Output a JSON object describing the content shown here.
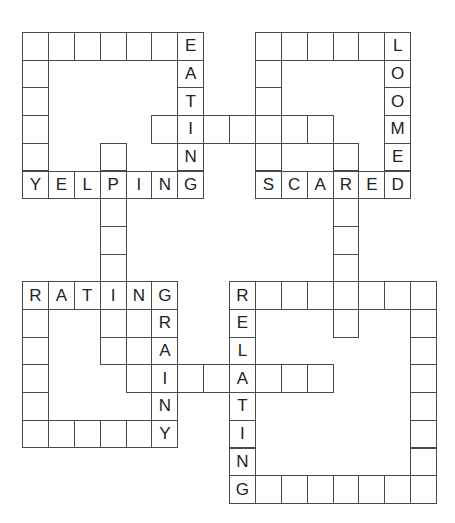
{
  "puzzle": {
    "type": "crossword",
    "words": [
      {
        "id": "top-left-box",
        "label": "",
        "cells": "box"
      },
      {
        "word": "EATING",
        "direction": "down"
      },
      {
        "word": "YELPING",
        "direction": "across"
      },
      {
        "word": "LOOMED",
        "direction": "down"
      },
      {
        "word": "SCARED",
        "direction": "across"
      },
      {
        "word": "RATING",
        "direction": "across"
      },
      {
        "word": "GRAINY",
        "direction": "down"
      },
      {
        "word": "RELATING",
        "direction": "down"
      }
    ],
    "cells": [
      {
        "r": 0,
        "c": 0,
        "ch": ""
      },
      {
        "r": 0,
        "c": 1,
        "ch": ""
      },
      {
        "r": 0,
        "c": 2,
        "ch": ""
      },
      {
        "r": 0,
        "c": 3,
        "ch": ""
      },
      {
        "r": 0,
        "c": 4,
        "ch": ""
      },
      {
        "r": 0,
        "c": 5,
        "ch": ""
      },
      {
        "r": 0,
        "c": 6,
        "ch": "E"
      },
      {
        "r": 1,
        "c": 0,
        "ch": ""
      },
      {
        "r": 1,
        "c": 6,
        "ch": "A"
      },
      {
        "r": 2,
        "c": 0,
        "ch": ""
      },
      {
        "r": 2,
        "c": 6,
        "ch": "T"
      },
      {
        "r": 3,
        "c": 0,
        "ch": ""
      },
      {
        "r": 3,
        "c": 5,
        "ch": ""
      },
      {
        "r": 3,
        "c": 6,
        "ch": "I"
      },
      {
        "r": 3,
        "c": 7,
        "ch": ""
      },
      {
        "r": 3,
        "c": 8,
        "ch": ""
      },
      {
        "r": 3,
        "c": 9,
        "ch": ""
      },
      {
        "r": 3,
        "c": 10,
        "ch": ""
      },
      {
        "r": 3,
        "c": 11,
        "ch": ""
      },
      {
        "r": 4,
        "c": 0,
        "ch": ""
      },
      {
        "r": 4,
        "c": 3,
        "ch": ""
      },
      {
        "r": 4,
        "c": 6,
        "ch": "N"
      },
      {
        "r": 5,
        "c": 0,
        "ch": "Y"
      },
      {
        "r": 5,
        "c": 1,
        "ch": "E"
      },
      {
        "r": 5,
        "c": 2,
        "ch": "L"
      },
      {
        "r": 5,
        "c": 3,
        "ch": "P"
      },
      {
        "r": 5,
        "c": 4,
        "ch": "I"
      },
      {
        "r": 5,
        "c": 5,
        "ch": "N"
      },
      {
        "r": 5,
        "c": 6,
        "ch": "G"
      },
      {
        "r": 0,
        "c": 9,
        "ch": ""
      },
      {
        "r": 0,
        "c": 10,
        "ch": ""
      },
      {
        "r": 0,
        "c": 11,
        "ch": ""
      },
      {
        "r": 0,
        "c": 12,
        "ch": ""
      },
      {
        "r": 0,
        "c": 13,
        "ch": ""
      },
      {
        "r": 0,
        "c": 14,
        "ch": "L"
      },
      {
        "r": 1,
        "c": 9,
        "ch": ""
      },
      {
        "r": 1,
        "c": 14,
        "ch": "O"
      },
      {
        "r": 2,
        "c": 9,
        "ch": ""
      },
      {
        "r": 2,
        "c": 14,
        "ch": "O"
      },
      {
        "r": 3,
        "c": 14,
        "ch": "M"
      },
      {
        "r": 4,
        "c": 9,
        "ch": ""
      },
      {
        "r": 4,
        "c": 12,
        "ch": ""
      },
      {
        "r": 4,
        "c": 14,
        "ch": "E"
      },
      {
        "r": 5,
        "c": 9,
        "ch": "S"
      },
      {
        "r": 5,
        "c": 10,
        "ch": "C"
      },
      {
        "r": 5,
        "c": 11,
        "ch": "A"
      },
      {
        "r": 5,
        "c": 12,
        "ch": "R"
      },
      {
        "r": 5,
        "c": 13,
        "ch": "E"
      },
      {
        "r": 5,
        "c": 14,
        "ch": "D"
      },
      {
        "r": 6,
        "c": 3,
        "ch": ""
      },
      {
        "r": 7,
        "c": 3,
        "ch": ""
      },
      {
        "r": 8,
        "c": 3,
        "ch": ""
      },
      {
        "r": 6,
        "c": 12,
        "ch": ""
      },
      {
        "r": 7,
        "c": 12,
        "ch": ""
      },
      {
        "r": 8,
        "c": 12,
        "ch": ""
      },
      {
        "r": 9,
        "c": 0,
        "ch": "R"
      },
      {
        "r": 9,
        "c": 1,
        "ch": "A"
      },
      {
        "r": 9,
        "c": 2,
        "ch": "T"
      },
      {
        "r": 9,
        "c": 3,
        "ch": "I"
      },
      {
        "r": 9,
        "c": 4,
        "ch": "N"
      },
      {
        "r": 9,
        "c": 5,
        "ch": "G"
      },
      {
        "r": 10,
        "c": 0,
        "ch": ""
      },
      {
        "r": 10,
        "c": 3,
        "ch": ""
      },
      {
        "r": 10,
        "c": 4,
        "ch": ""
      },
      {
        "r": 10,
        "c": 5,
        "ch": "R"
      },
      {
        "r": 11,
        "c": 0,
        "ch": ""
      },
      {
        "r": 11,
        "c": 3,
        "ch": ""
      },
      {
        "r": 11,
        "c": 4,
        "ch": ""
      },
      {
        "r": 11,
        "c": 5,
        "ch": "A"
      },
      {
        "r": 12,
        "c": 0,
        "ch": ""
      },
      {
        "r": 12,
        "c": 4,
        "ch": ""
      },
      {
        "r": 12,
        "c": 5,
        "ch": "I"
      },
      {
        "r": 12,
        "c": 6,
        "ch": ""
      },
      {
        "r": 12,
        "c": 7,
        "ch": ""
      },
      {
        "r": 13,
        "c": 0,
        "ch": ""
      },
      {
        "r": 13,
        "c": 5,
        "ch": "N"
      },
      {
        "r": 14,
        "c": 0,
        "ch": ""
      },
      {
        "r": 14,
        "c": 1,
        "ch": ""
      },
      {
        "r": 14,
        "c": 2,
        "ch": ""
      },
      {
        "r": 14,
        "c": 3,
        "ch": ""
      },
      {
        "r": 14,
        "c": 4,
        "ch": ""
      },
      {
        "r": 14,
        "c": 5,
        "ch": "Y"
      },
      {
        "r": 9,
        "c": 8,
        "ch": "R"
      },
      {
        "r": 9,
        "c": 9,
        "ch": ""
      },
      {
        "r": 9,
        "c": 10,
        "ch": ""
      },
      {
        "r": 9,
        "c": 11,
        "ch": ""
      },
      {
        "r": 9,
        "c": 12,
        "ch": ""
      },
      {
        "r": 9,
        "c": 13,
        "ch": ""
      },
      {
        "r": 9,
        "c": 14,
        "ch": ""
      },
      {
        "r": 9,
        "c": 15,
        "ch": ""
      },
      {
        "r": 10,
        "c": 8,
        "ch": "E"
      },
      {
        "r": 10,
        "c": 12,
        "ch": ""
      },
      {
        "r": 10,
        "c": 15,
        "ch": ""
      },
      {
        "r": 11,
        "c": 8,
        "ch": "L"
      },
      {
        "r": 11,
        "c": 15,
        "ch": ""
      },
      {
        "r": 12,
        "c": 8,
        "ch": "A"
      },
      {
        "r": 12,
        "c": 9,
        "ch": ""
      },
      {
        "r": 12,
        "c": 10,
        "ch": ""
      },
      {
        "r": 12,
        "c": 11,
        "ch": ""
      },
      {
        "r": 12,
        "c": 15,
        "ch": ""
      },
      {
        "r": 13,
        "c": 8,
        "ch": "T"
      },
      {
        "r": 13,
        "c": 15,
        "ch": ""
      },
      {
        "r": 14,
        "c": 8,
        "ch": "I"
      },
      {
        "r": 14,
        "c": 15,
        "ch": ""
      },
      {
        "r": 15,
        "c": 8,
        "ch": "N"
      },
      {
        "r": 15,
        "c": 15,
        "ch": ""
      },
      {
        "r": 16,
        "c": 8,
        "ch": "G"
      },
      {
        "r": 16,
        "c": 9,
        "ch": ""
      },
      {
        "r": 16,
        "c": 10,
        "ch": ""
      },
      {
        "r": 16,
        "c": 11,
        "ch": ""
      },
      {
        "r": 16,
        "c": 12,
        "ch": ""
      },
      {
        "r": 16,
        "c": 13,
        "ch": ""
      },
      {
        "r": 16,
        "c": 14,
        "ch": ""
      },
      {
        "r": 16,
        "c": 15,
        "ch": ""
      }
    ]
  }
}
